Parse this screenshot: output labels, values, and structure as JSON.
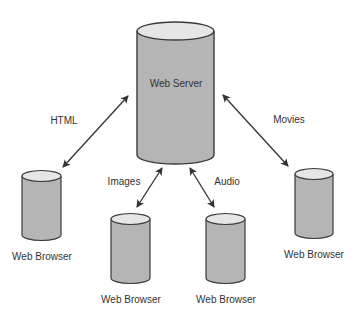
{
  "server": {
    "label": "Web Server"
  },
  "clients": [
    {
      "label": "Web Browser",
      "link_label": "HTML"
    },
    {
      "label": "Web Browser",
      "link_label": "Images"
    },
    {
      "label": "Web Browser",
      "link_label": "Audio"
    },
    {
      "label": "Web Browser",
      "link_label": "Movies"
    }
  ],
  "colors": {
    "cylinder_body": "#b5b5b5",
    "cylinder_top": "#e6e6e6",
    "outline": "#3a3a3a",
    "arrow": "#333333",
    "text": "#333333"
  }
}
